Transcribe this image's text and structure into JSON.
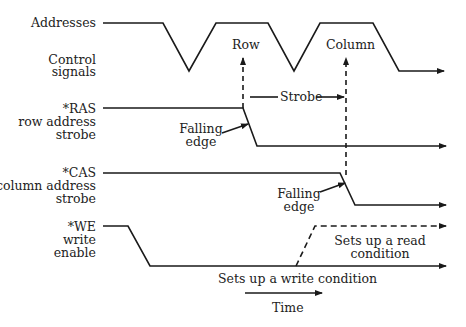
{
  "diagram": {
    "type": "timing-diagram",
    "signals": [
      {
        "id": "addresses",
        "label": "Addresses"
      },
      {
        "id": "control",
        "label_line1": "Control",
        "label_line2": "signals"
      },
      {
        "id": "ras",
        "label_line1": "*RAS",
        "label_line2": "row address",
        "label_line3": "strobe"
      },
      {
        "id": "cas",
        "label_line1": "*CAS",
        "label_line2": "column address",
        "label_line3": "strobe"
      },
      {
        "id": "we",
        "label_line1": "*WE",
        "label_line2": "write",
        "label_line3": "enable"
      }
    ],
    "annotations": {
      "row": "Row",
      "column": "Column",
      "strobe": "Strobe",
      "ras_falling_line1": "Falling",
      "ras_falling_line2": "edge",
      "cas_falling_line1": "Falling",
      "cas_falling_line2": "edge",
      "read_line1": "Sets up a read",
      "read_line2": "condition",
      "write": "Sets up a write condition",
      "time": "Time"
    },
    "colors": {
      "line": "#1a1a1a",
      "text": "#222222",
      "background": "#ffffff"
    }
  }
}
